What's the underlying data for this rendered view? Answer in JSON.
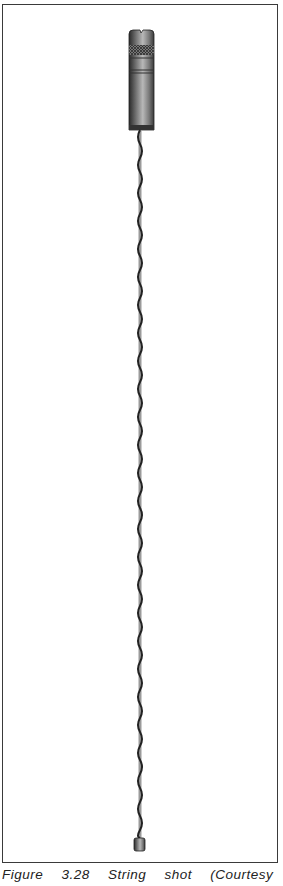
{
  "figure": {
    "caption": "Figure 3.28  String shot (Courtesy of NL",
    "frame_color": "#3a3a3a",
    "tool_color": "#4a4a4a"
  }
}
